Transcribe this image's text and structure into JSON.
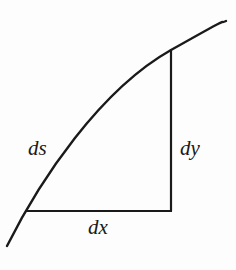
{
  "figure": {
    "labels": {
      "ds": "ds",
      "dy": "dy",
      "dx": "dx"
    },
    "colors": {
      "stroke": "#1a1a1a",
      "text": "#1a1a1a",
      "background": "#fdfdfd"
    },
    "elements": {
      "curve": "arc length curve ds",
      "vertical_leg": "dy",
      "horizontal_leg": "dx"
    }
  }
}
